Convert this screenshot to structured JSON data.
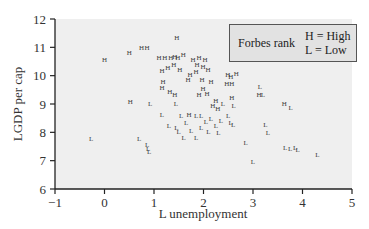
{
  "chart_data": {
    "type": "scatter",
    "title": "",
    "xlabel": "L unemployment",
    "ylabel": "LGDP per cap",
    "xlim": [
      -1,
      5
    ],
    "ylim": [
      6,
      12
    ],
    "xticks": [
      -1,
      0,
      1,
      2,
      3,
      4,
      5
    ],
    "yticks": [
      6,
      7,
      8,
      9,
      10,
      11,
      12
    ],
    "grid": false,
    "background": "#efefef",
    "legend": {
      "title": "Forbes rank",
      "entries": [
        "H = High",
        "L = Low"
      ],
      "position": "upper right"
    },
    "series": [
      {
        "name": "High",
        "marker": "H",
        "points": [
          [
            0.0,
            10.55
          ],
          [
            0.5,
            10.8
          ],
          [
            0.75,
            10.95
          ],
          [
            0.86,
            10.95
          ],
          [
            1.46,
            11.3
          ],
          [
            1.1,
            10.6
          ],
          [
            1.22,
            10.6
          ],
          [
            1.34,
            10.6
          ],
          [
            1.42,
            10.65
          ],
          [
            1.48,
            10.6
          ],
          [
            1.59,
            10.7
          ],
          [
            1.16,
            10.15
          ],
          [
            1.28,
            10.25
          ],
          [
            1.4,
            10.35
          ],
          [
            1.52,
            10.2
          ],
          [
            1.79,
            10.55
          ],
          [
            1.91,
            10.6
          ],
          [
            2.03,
            10.55
          ],
          [
            1.87,
            10.35
          ],
          [
            1.99,
            10.3
          ],
          [
            2.09,
            10.2
          ],
          [
            1.73,
            10.0
          ],
          [
            1.85,
            10.1
          ],
          [
            1.18,
            9.75
          ],
          [
            1.16,
            9.55
          ],
          [
            1.32,
            9.4
          ],
          [
            1.42,
            9.3
          ],
          [
            0.52,
            9.05
          ],
          [
            1.69,
            9.85
          ],
          [
            1.97,
            9.85
          ],
          [
            2.15,
            9.75
          ],
          [
            1.99,
            9.5
          ],
          [
            2.07,
            9.35
          ],
          [
            1.91,
            9.3
          ],
          [
            2.49,
            10.0
          ],
          [
            2.55,
            9.95
          ],
          [
            2.66,
            10.05
          ],
          [
            2.47,
            9.7
          ],
          [
            2.57,
            9.7
          ],
          [
            2.57,
            9.2
          ],
          [
            3.12,
            9.3
          ],
          [
            3.63,
            9.0
          ],
          [
            2.19,
            8.9
          ],
          [
            2.29,
            8.8
          ],
          [
            1.71,
            8.6
          ],
          [
            2.25,
            9.1
          ]
        ]
      },
      {
        "name": "Low",
        "marker": "L",
        "points": [
          [
            0.92,
            9.0
          ],
          [
            1.16,
            8.6
          ],
          [
            1.44,
            9.0
          ],
          [
            2.39,
            9.0
          ],
          [
            2.61,
            8.9
          ],
          [
            3.14,
            9.6
          ],
          [
            3.2,
            9.3
          ],
          [
            3.76,
            8.85
          ],
          [
            1.55,
            8.55
          ],
          [
            1.65,
            8.3
          ],
          [
            1.85,
            8.55
          ],
          [
            1.95,
            8.55
          ],
          [
            2.05,
            8.35
          ],
          [
            2.15,
            8.45
          ],
          [
            2.35,
            8.4
          ],
          [
            2.5,
            8.55
          ],
          [
            2.55,
            8.3
          ],
          [
            2.6,
            8.25
          ],
          [
            1.5,
            8.0
          ],
          [
            1.45,
            8.15
          ],
          [
            1.6,
            7.8
          ],
          [
            1.75,
            8.05
          ],
          [
            1.85,
            7.8
          ],
          [
            2.1,
            8.0
          ],
          [
            2.3,
            7.95
          ],
          [
            1.3,
            8.2
          ],
          [
            1.95,
            8.15
          ],
          [
            2.25,
            8.2
          ],
          [
            3.25,
            8.25
          ],
          [
            3.3,
            7.95
          ],
          [
            2.85,
            7.6
          ],
          [
            3.0,
            6.95
          ],
          [
            3.65,
            7.45
          ],
          [
            3.75,
            7.4
          ],
          [
            3.85,
            7.45
          ],
          [
            3.9,
            7.35
          ],
          [
            4.3,
            7.2
          ],
          [
            -0.27,
            7.75
          ],
          [
            0.7,
            7.75
          ],
          [
            0.86,
            7.55
          ],
          [
            0.88,
            7.4
          ],
          [
            0.9,
            7.3
          ]
        ]
      }
    ]
  }
}
